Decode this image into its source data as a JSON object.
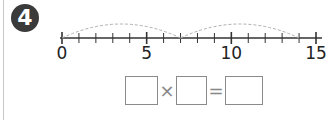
{
  "problem": {
    "number": "4"
  },
  "number_line": {
    "min": 0,
    "max": 15,
    "tick_step": 1,
    "labels": [
      {
        "value": 0,
        "text": "0"
      },
      {
        "value": 5,
        "text": "5"
      },
      {
        "value": 10,
        "text": "10"
      },
      {
        "value": 15,
        "text": "15"
      }
    ],
    "jumps": [
      {
        "from": 0,
        "to": 7
      },
      {
        "from": 7,
        "to": 14
      }
    ]
  },
  "equation": {
    "operator_multiply": "×",
    "operator_equals": "=",
    "box_1": "",
    "box_2": "",
    "box_3": ""
  },
  "colors": {
    "badge": "#3a3a3a",
    "line": "#333333",
    "arc": "#b0b0b0",
    "box_border": "#8a8a8a"
  }
}
